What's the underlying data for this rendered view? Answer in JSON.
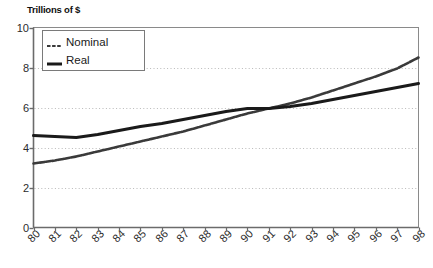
{
  "chart_data": {
    "type": "line",
    "title": "Trillions of $",
    "xlabel": "",
    "ylabel": "Trillions of $",
    "ylim": [
      0,
      10
    ],
    "yticks": [
      0,
      2,
      4,
      6,
      8,
      10
    ],
    "grid": "horizontal-dotted",
    "legend_position": "top-left-inside",
    "categories": [
      "80",
      "81",
      "82",
      "83",
      "84",
      "85",
      "86",
      "87",
      "88",
      "89",
      "90",
      "91",
      "92",
      "93",
      "94",
      "95",
      "96",
      "97",
      "98"
    ],
    "series": [
      {
        "name": "Nominal",
        "style": "dashed-thin",
        "color": "#3a3a3a",
        "values": [
          3.2,
          3.35,
          3.55,
          3.8,
          4.05,
          4.3,
          4.55,
          4.8,
          5.1,
          5.4,
          5.7,
          5.95,
          6.2,
          6.5,
          6.85,
          7.2,
          7.55,
          7.95,
          8.5
        ]
      },
      {
        "name": "Real",
        "style": "solid-thick",
        "color": "#1a1a1a",
        "values": [
          4.6,
          4.55,
          4.5,
          4.65,
          4.85,
          5.05,
          5.2,
          5.4,
          5.6,
          5.8,
          5.95,
          5.95,
          6.05,
          6.2,
          6.4,
          6.6,
          6.8,
          7.0,
          7.2
        ]
      }
    ]
  },
  "legend": {
    "items": [
      {
        "label": "Nominal",
        "swatch": "dashed-line-swatch"
      },
      {
        "label": "Real",
        "swatch": "solid-line-swatch"
      }
    ]
  }
}
